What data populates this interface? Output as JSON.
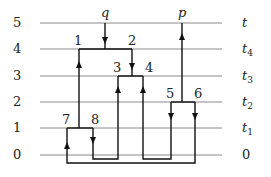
{
  "levels": [
    {
      "index": "5",
      "right": "t",
      "sub": ""
    },
    {
      "index": "4",
      "right": "t",
      "sub": "4"
    },
    {
      "index": "3",
      "right": "t",
      "sub": "3"
    },
    {
      "index": "2",
      "right": "t",
      "sub": "2"
    },
    {
      "index": "1",
      "right": "t",
      "sub": "1"
    },
    {
      "index": "0",
      "right": "0",
      "sub": ""
    }
  ],
  "inputs": {
    "q": "q",
    "p": "p"
  },
  "nodes": {
    "n1": "1",
    "n2": "2",
    "n3": "3",
    "n4": "4",
    "n5": "5",
    "n6": "6",
    "n7": "7",
    "n8": "8"
  },
  "colors": {
    "grid": "#8a8a8a",
    "wire": "#111111"
  }
}
